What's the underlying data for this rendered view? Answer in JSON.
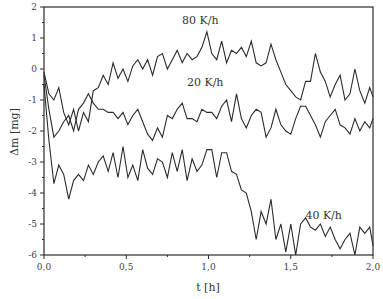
{
  "chart_data": {
    "type": "line",
    "title": "",
    "xlabel": "t [h]",
    "ylabel": "Δm [mg]",
    "xlim": [
      0.0,
      2.0
    ],
    "ylim": [
      -6,
      2
    ],
    "grid": false,
    "legend": "inline labels",
    "x_ticks": [
      "0,0",
      "0,5",
      "1,0",
      "1,5",
      "2,0"
    ],
    "x_tick_values": [
      0.0,
      0.5,
      1.0,
      1.5,
      2.0
    ],
    "y_ticks": [
      "2",
      "1",
      "0",
      "-1",
      "-2",
      "-3",
      "-4",
      "-5",
      "-6"
    ],
    "y_tick_values": [
      2,
      1,
      0,
      -1,
      -2,
      -3,
      -4,
      -5,
      -6
    ],
    "series": [
      {
        "name": "80 K/h",
        "label_pos": [
          0.95,
          1.45
        ],
        "x": [
          0.0,
          0.03,
          0.06,
          0.09,
          0.12,
          0.15,
          0.18,
          0.21,
          0.24,
          0.27,
          0.3,
          0.33,
          0.36,
          0.39,
          0.42,
          0.45,
          0.48,
          0.51,
          0.54,
          0.57,
          0.6,
          0.63,
          0.66,
          0.69,
          0.72,
          0.75,
          0.78,
          0.81,
          0.84,
          0.87,
          0.9,
          0.93,
          0.96,
          0.99,
          1.02,
          1.05,
          1.08,
          1.11,
          1.14,
          1.17,
          1.2,
          1.23,
          1.26,
          1.29,
          1.32,
          1.35,
          1.38,
          1.41,
          1.44,
          1.47,
          1.5,
          1.53,
          1.56,
          1.59,
          1.62,
          1.65,
          1.68,
          1.71,
          1.74,
          1.77,
          1.8,
          1.83,
          1.86,
          1.89,
          1.92,
          1.95,
          1.98,
          2.0
        ],
        "y": [
          -0.1,
          -0.8,
          -1.0,
          -0.6,
          -1.4,
          -1.8,
          -1.3,
          -2.0,
          -1.4,
          -1.7,
          -0.7,
          -0.6,
          -0.2,
          -0.5,
          0.2,
          -0.3,
          0.0,
          -0.4,
          0.1,
          0.3,
          0.0,
          0.3,
          -0.2,
          0.4,
          0.5,
          0.0,
          0.3,
          0.6,
          0.2,
          0.5,
          0.3,
          0.4,
          0.7,
          1.2,
          0.5,
          0.3,
          0.9,
          0.2,
          0.6,
          0.5,
          0.7,
          0.4,
          0.9,
          0.2,
          0.1,
          0.2,
          0.8,
          0.3,
          -0.1,
          -0.5,
          -0.7,
          -0.9,
          -1.0,
          -0.4,
          -0.4,
          0.5,
          -0.1,
          -0.4,
          -0.9,
          -0.5,
          -0.2,
          -1.0,
          -0.8,
          0.0,
          -0.7,
          -1.1,
          -0.6,
          -0.9
        ]
      },
      {
        "name": "20 K/h",
        "label_pos": [
          0.98,
          -0.55
        ],
        "x": [
          0.0,
          0.03,
          0.06,
          0.09,
          0.12,
          0.15,
          0.18,
          0.21,
          0.24,
          0.27,
          0.3,
          0.33,
          0.36,
          0.39,
          0.42,
          0.45,
          0.48,
          0.51,
          0.54,
          0.57,
          0.6,
          0.63,
          0.66,
          0.69,
          0.72,
          0.75,
          0.78,
          0.81,
          0.84,
          0.87,
          0.9,
          0.93,
          0.96,
          0.99,
          1.02,
          1.05,
          1.08,
          1.11,
          1.14,
          1.17,
          1.2,
          1.23,
          1.26,
          1.29,
          1.32,
          1.35,
          1.38,
          1.41,
          1.44,
          1.47,
          1.5,
          1.53,
          1.56,
          1.59,
          1.62,
          1.65,
          1.68,
          1.71,
          1.74,
          1.77,
          1.8,
          1.83,
          1.86,
          1.89,
          1.92,
          1.95,
          1.98,
          2.0
        ],
        "y": [
          -0.2,
          -1.3,
          -2.2,
          -2.0,
          -1.7,
          -1.5,
          -2.0,
          -1.3,
          -1.1,
          -0.8,
          -1.1,
          -1.3,
          -1.3,
          -1.4,
          -1.4,
          -1.6,
          -1.4,
          -1.8,
          -1.5,
          -1.3,
          -1.7,
          -2.1,
          -2.3,
          -1.9,
          -2.2,
          -1.5,
          -1.6,
          -1.3,
          -1.1,
          -1.6,
          -1.6,
          -1.7,
          -1.3,
          -1.4,
          -1.4,
          -1.6,
          -1.2,
          -1.0,
          -1.7,
          -0.8,
          -1.6,
          -1.9,
          -1.5,
          -1.3,
          -1.4,
          -2.2,
          -1.9,
          -1.3,
          -1.8,
          -2.0,
          -2.1,
          -1.6,
          -1.2,
          -1.2,
          -1.5,
          -1.8,
          -2.2,
          -1.7,
          -1.5,
          -1.3,
          -1.8,
          -1.9,
          -2.1,
          -1.6,
          -2.0,
          -1.7,
          -1.9,
          -1.6
        ]
      },
      {
        "name": "40 K/h",
        "label_pos": [
          1.7,
          -4.85
        ],
        "x": [
          0.0,
          0.03,
          0.06,
          0.09,
          0.12,
          0.15,
          0.18,
          0.21,
          0.24,
          0.27,
          0.3,
          0.33,
          0.36,
          0.39,
          0.42,
          0.45,
          0.48,
          0.51,
          0.54,
          0.57,
          0.6,
          0.63,
          0.66,
          0.69,
          0.72,
          0.75,
          0.78,
          0.81,
          0.84,
          0.87,
          0.9,
          0.93,
          0.96,
          0.99,
          1.02,
          1.05,
          1.08,
          1.11,
          1.14,
          1.17,
          1.2,
          1.23,
          1.26,
          1.29,
          1.32,
          1.35,
          1.38,
          1.41,
          1.44,
          1.47,
          1.5,
          1.53,
          1.56,
          1.59,
          1.62,
          1.65,
          1.68,
          1.71,
          1.74,
          1.77,
          1.8,
          1.83,
          1.86,
          1.89,
          1.92,
          1.95,
          1.98,
          2.0
        ],
        "y": [
          -0.5,
          -2.3,
          -3.7,
          -3.1,
          -3.4,
          -4.2,
          -3.6,
          -3.4,
          -3.6,
          -3.1,
          -3.4,
          -3.0,
          -2.8,
          -3.3,
          -2.7,
          -3.5,
          -2.5,
          -3.5,
          -3.1,
          -3.6,
          -2.6,
          -3.2,
          -3.4,
          -2.9,
          -3.0,
          -3.5,
          -2.7,
          -3.3,
          -2.6,
          -3.6,
          -2.9,
          -3.3,
          -3.1,
          -2.6,
          -2.6,
          -3.5,
          -2.7,
          -2.7,
          -3.3,
          -3.4,
          -3.9,
          -4.0,
          -4.6,
          -5.5,
          -4.6,
          -5.0,
          -4.2,
          -5.5,
          -5.0,
          -5.9,
          -5.0,
          -6.0,
          -5.0,
          -4.8,
          -5.1,
          -5.2,
          -5.0,
          -5.4,
          -5.1,
          -5.5,
          -5.8,
          -5.5,
          -5.3,
          -6.0,
          -5.1,
          -5.3,
          -5.1,
          -5.7
        ]
      }
    ]
  }
}
